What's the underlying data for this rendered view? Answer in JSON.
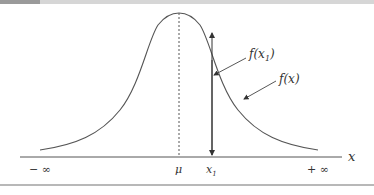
{
  "diagram": {
    "axis_label": "x",
    "left_limit": "− ∞",
    "right_limit": "+ ∞",
    "mean_label": "μ",
    "x1_label": "x",
    "x1_sub": "1",
    "fx1_label_pre": "f(x",
    "fx1_label_sub": "1",
    "fx1_label_post": ")",
    "fx_label": "f(x)",
    "colors": {
      "curve": "#555555",
      "axis": "#555555",
      "frame": "#b8b8b8"
    }
  }
}
